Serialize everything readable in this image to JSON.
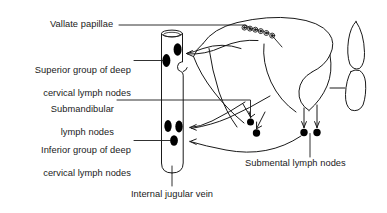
{
  "figure": {
    "type": "anatomical-diagram",
    "background_color": "#ffffff",
    "line_color": "#1a1a1a",
    "node_fill_color": "#000000",
    "text_color": "#1a1a1a"
  },
  "labels": {
    "vallate_papillae": "Vallate papillae",
    "superior_deep_cervical_line1": "Superior group of deep",
    "superior_deep_cervical_line2": "cervical lymph nodes",
    "submandibular_line1": "Submandibular",
    "submandibular_line2": "lymph nodes",
    "inferior_deep_cervical_line1": "Inferior group of deep",
    "inferior_deep_cervical_line2": "cervical lymph nodes",
    "internal_jugular_vein": "Internal jugular vein",
    "submental_lymph_nodes": "Submental lymph nodes"
  },
  "structures": {
    "internal_jugular_vein": "internal-jugular-vein",
    "tongue": "tongue-outline",
    "epiglottis": "epiglottis-outline",
    "vallate_papillae_count": 6,
    "deep_cervical_nodes_count": 5,
    "submental_nodes_count": 2,
    "submandibular_nodes_count": 2
  }
}
